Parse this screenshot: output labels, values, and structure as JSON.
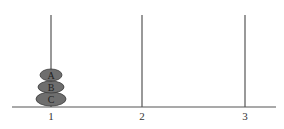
{
  "diagram": {
    "type": "towers-of-hanoi",
    "colors": {
      "line": "#555555",
      "disk_fill": "#6e6e6e",
      "disk_stroke": "#3a3a3a",
      "text": "#222222"
    },
    "pegs": [
      {
        "label": "1",
        "x": 51,
        "disks": [
          "A",
          "B",
          "C"
        ]
      },
      {
        "label": "2",
        "x": 142,
        "disks": []
      },
      {
        "label": "3",
        "x": 245,
        "disks": []
      }
    ],
    "disks": [
      {
        "label": "A",
        "cy": 75,
        "rx": 11,
        "ry": 6
      },
      {
        "label": "B",
        "cy": 87,
        "rx": 13,
        "ry": 6
      },
      {
        "label": "C",
        "cy": 99,
        "rx": 15,
        "ry": 7
      }
    ]
  }
}
